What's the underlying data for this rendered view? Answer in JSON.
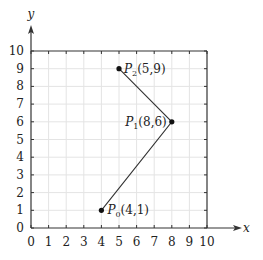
{
  "chart_data": {
    "type": "line",
    "title": "",
    "xlabel": "x",
    "ylabel": "y",
    "xlim": [
      0,
      10
    ],
    "ylim": [
      0,
      10
    ],
    "grid": true,
    "x_ticks": [
      0,
      1,
      2,
      3,
      4,
      5,
      6,
      7,
      8,
      9,
      10
    ],
    "y_ticks": [
      0,
      1,
      2,
      3,
      4,
      5,
      6,
      7,
      8,
      9,
      10
    ],
    "series": [
      {
        "name": "polyline",
        "points": [
          {
            "label": "P0",
            "sub": "0",
            "coord": "(4,1)",
            "x": 4,
            "y": 1
          },
          {
            "label": "P1",
            "sub": "1",
            "coord": "(8,6)",
            "x": 8,
            "y": 6
          },
          {
            "label": "P2",
            "sub": "2",
            "coord": "(5,9)",
            "x": 5,
            "y": 9
          }
        ]
      }
    ],
    "annotations": [
      "P0(4,1)",
      "P1(8,6)",
      "P2(5,9)"
    ]
  },
  "colors": {
    "axis": "#333333",
    "grid": "#e4e4e4",
    "line": "#333333",
    "point": "#111111"
  }
}
